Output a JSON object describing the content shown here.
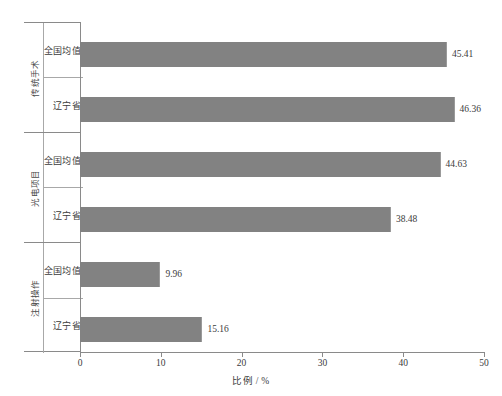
{
  "chart_data": {
    "type": "bar",
    "orientation": "horizontal",
    "title": "",
    "xlabel": "比例 / %",
    "ylabel": "",
    "xlim": [
      0,
      50
    ],
    "xticks": [
      0,
      10,
      20,
      30,
      40,
      50
    ],
    "grid": false,
    "legend": "none",
    "series_color": "#828282",
    "groups": [
      {
        "group_label": "传统手术",
        "categories": [
          "全国均值",
          "辽宁省"
        ],
        "values": [
          45.41,
          46.36
        ],
        "value_labels": [
          "45.41",
          "46.36"
        ]
      },
      {
        "group_label": "光电项目",
        "categories": [
          "全国均值",
          "辽宁省"
        ],
        "values": [
          44.63,
          38.48
        ],
        "value_labels": [
          "44.63",
          "38.48"
        ]
      },
      {
        "group_label": "注射操作",
        "categories": [
          "全国均值",
          "辽宁省"
        ],
        "values": [
          9.96,
          15.16
        ],
        "value_labels": [
          "9.96",
          "15.16"
        ]
      }
    ],
    "bars": [
      {
        "group": "传统手术",
        "category": "全国均值",
        "value": 45.41,
        "label": "45.41"
      },
      {
        "group": "传统手术",
        "category": "辽宁省",
        "value": 46.36,
        "label": "46.36"
      },
      {
        "group": "光电项目",
        "category": "全国均值",
        "value": 44.63,
        "label": "44.63"
      },
      {
        "group": "光电项目",
        "category": "辽宁省",
        "value": 38.48,
        "label": "38.48"
      },
      {
        "group": "注射操作",
        "category": "全国均值",
        "value": 9.96,
        "label": "9.96"
      },
      {
        "group": "注射操作",
        "category": "辽宁省",
        "value": 15.16,
        "label": "15.16"
      }
    ]
  },
  "axis": {
    "x_tick_labels": [
      "0",
      "10",
      "20",
      "30",
      "40",
      "50"
    ],
    "x_title": "比例 / %"
  },
  "groups_flat": {
    "g0_label": "传统手术",
    "g1_label": "光电项目",
    "g2_label": "注射操作",
    "r0": "全国均值",
    "r1": "辽宁省",
    "r2": "全国均值",
    "r3": "辽宁省",
    "r4": "全国均值",
    "r5": "辽宁省",
    "v0": "45.41",
    "v1": "46.36",
    "v2": "44.63",
    "v3": "38.48",
    "v4": "9.96",
    "v5": "15.16"
  }
}
